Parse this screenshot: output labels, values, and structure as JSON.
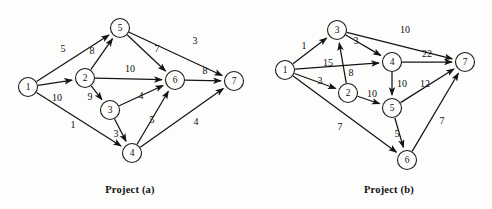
{
  "figure": {
    "background_color": "#fdfdfc",
    "line_color": "#141414",
    "node_fill": "#fdfdfc",
    "node_radius": 9.5,
    "arrow_marker": "filled-triangle-arrowhead"
  },
  "graphs": [
    {
      "id": "project-a",
      "caption": "Project (a)",
      "caption_pos": {
        "x": 130,
        "y": 189
      },
      "nodes": [
        {
          "id": "1",
          "label": "1",
          "x": 28,
          "y": 87
        },
        {
          "id": "2",
          "label": "2",
          "x": 85,
          "y": 78
        },
        {
          "id": "3",
          "label": "3",
          "x": 110,
          "y": 110
        },
        {
          "id": "4",
          "label": "4",
          "x": 132,
          "y": 153
        },
        {
          "id": "5",
          "label": "5",
          "x": 120,
          "y": 28
        },
        {
          "id": "6",
          "label": "6",
          "x": 175,
          "y": 80
        },
        {
          "id": "7",
          "label": "7",
          "x": 234,
          "y": 81
        }
      ],
      "edges": [
        {
          "from": "1",
          "to": "5",
          "weight": "5",
          "lx": 63,
          "ly": 48
        },
        {
          "from": "1",
          "to": "2",
          "weight": "10",
          "lx": 57,
          "ly": 97
        },
        {
          "from": "1",
          "to": "4",
          "weight": "1",
          "lx": 73,
          "ly": 124
        },
        {
          "from": "2",
          "to": "5",
          "weight": "8",
          "lx": 92,
          "ly": 50
        },
        {
          "from": "2",
          "to": "6",
          "weight": "10",
          "lx": 130,
          "ly": 68
        },
        {
          "from": "2",
          "to": "3",
          "weight": "9",
          "lx": 90,
          "ly": 96
        },
        {
          "from": "3",
          "to": "6",
          "weight": "4",
          "lx": 141,
          "ly": 95
        },
        {
          "from": "3",
          "to": "4",
          "weight": "3",
          "lx": 116,
          "ly": 133
        },
        {
          "from": "4",
          "to": "6",
          "weight": "5",
          "lx": 152,
          "ly": 119
        },
        {
          "from": "4",
          "to": "7",
          "weight": "4",
          "lx": 196,
          "ly": 121
        },
        {
          "from": "5",
          "to": "6",
          "weight": "7",
          "lx": 157,
          "ly": 48
        },
        {
          "from": "5",
          "to": "7",
          "weight": "3",
          "lx": 195,
          "ly": 40
        },
        {
          "from": "6",
          "to": "7",
          "weight": "8",
          "lx": 205,
          "ly": 70
        }
      ]
    },
    {
      "id": "project-b",
      "caption": "Project (b)",
      "caption_pos": {
        "x": 389,
        "y": 189
      },
      "nodes": [
        {
          "id": "1",
          "label": "1",
          "x": 285,
          "y": 70
        },
        {
          "id": "2",
          "label": "2",
          "x": 348,
          "y": 93
        },
        {
          "id": "3",
          "label": "3",
          "x": 337,
          "y": 30
        },
        {
          "id": "4",
          "label": "4",
          "x": 392,
          "y": 62
        },
        {
          "id": "5",
          "label": "5",
          "x": 392,
          "y": 108
        },
        {
          "id": "6",
          "label": "6",
          "x": 407,
          "y": 160
        },
        {
          "id": "7",
          "label": "7",
          "x": 465,
          "y": 62
        }
      ],
      "edges": [
        {
          "from": "1",
          "to": "3",
          "weight": "1",
          "lx": 304,
          "ly": 45
        },
        {
          "from": "1",
          "to": "4",
          "weight": "15",
          "lx": 328,
          "ly": 62
        },
        {
          "from": "1",
          "to": "2",
          "weight": "3",
          "lx": 320,
          "ly": 80
        },
        {
          "from": "1",
          "to": "6",
          "weight": "7",
          "lx": 340,
          "ly": 126
        },
        {
          "from": "2",
          "to": "3",
          "weight": "8",
          "lx": 351,
          "ly": 72
        },
        {
          "from": "2",
          "to": "5",
          "weight": "10",
          "lx": 372,
          "ly": 93
        },
        {
          "from": "3",
          "to": "4",
          "weight": "3",
          "lx": 356,
          "ly": 40
        },
        {
          "from": "3",
          "to": "7",
          "weight": "10",
          "lx": 405,
          "ly": 29
        },
        {
          "from": "4",
          "to": "7",
          "weight": "22",
          "lx": 427,
          "ly": 53
        },
        {
          "from": "4",
          "to": "5",
          "weight": "10",
          "lx": 402,
          "ly": 83
        },
        {
          "from": "5",
          "to": "7",
          "weight": "12",
          "lx": 425,
          "ly": 83
        },
        {
          "from": "5",
          "to": "6",
          "weight": "5",
          "lx": 397,
          "ly": 133
        },
        {
          "from": "6",
          "to": "7",
          "weight": "7",
          "lx": 442,
          "ly": 120
        }
      ]
    }
  ]
}
